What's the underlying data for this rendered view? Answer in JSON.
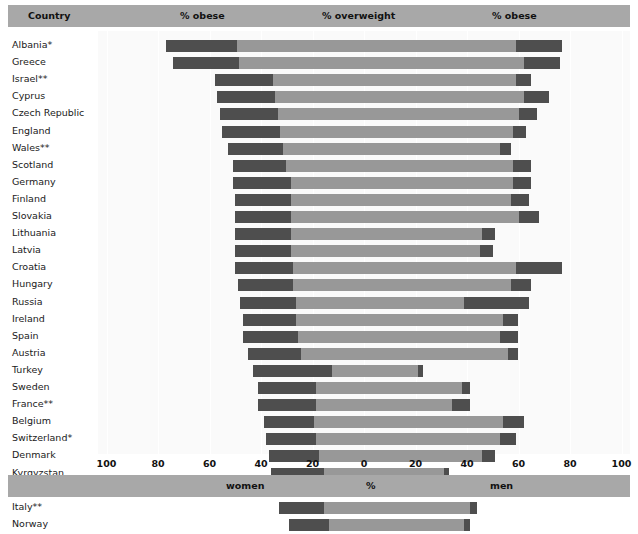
{
  "header": {
    "country_label": "Country",
    "left_section": "% obese",
    "middle_section": "% overweight",
    "right_section": "% obese"
  },
  "footer": {
    "left_label": "women",
    "middle_label": "%",
    "right_label": "men"
  },
  "axis": {
    "ticks": [
      "100",
      "80",
      "60",
      "40",
      "20",
      "0",
      "20",
      "40",
      "60",
      "80",
      "100"
    ],
    "tick_values": [
      -100,
      -80,
      -60,
      -40,
      -20,
      0,
      20,
      40,
      60,
      80,
      100
    ]
  },
  "chart_data": {
    "type": "bar",
    "title": "",
    "subtitle": "",
    "xlabel": "%",
    "ylabel": "Country",
    "xlim": [
      -100,
      100
    ],
    "grid": true,
    "legend": [
      "% obese",
      "% overweight"
    ],
    "legend_position": "top",
    "note": "Back-to-back (population pyramid) stacked bar chart. Women extend left from 0, men extend right from 0. Each side shows an inner dark '% obese' segment nearest the bar's outer end plus a lighter '% overweight' segment, plus an outer dark obese block.",
    "categories": [
      "Albania*",
      "Greece",
      "Israel**",
      "Cyprus",
      "Czech Republic",
      "England",
      "Wales**",
      "Scotland",
      "Germany",
      "Finland",
      "Slovakia",
      "Lithuania",
      "Latvia",
      "Croatia",
      "Hungary",
      "Russia",
      "Ireland",
      "Spain",
      "Austria",
      "Turkey",
      "Sweden",
      "France**",
      "Belgium",
      "Switzerland*",
      "Denmark",
      "Kyrgyzstan",
      "Netherlands",
      "Italy**",
      "Norway"
    ],
    "series": [
      {
        "name": "women_obese_outer",
        "side": "left",
        "values": [
          77,
          74,
          58,
          57,
          56,
          55,
          53,
          51,
          51,
          50,
          50,
          50,
          50,
          50,
          49,
          48,
          47,
          47,
          45,
          43,
          41,
          41,
          39,
          38,
          37,
          36,
          34,
          33,
          29
        ]
      },
      {
        "name": "women_obese_inner_break",
        "side": "left",
        "values": [
          58,
          57,
          44,
          43,
          42,
          41,
          40,
          39,
          37,
          37,
          37,
          37,
          37,
          36,
          36,
          35,
          35,
          34,
          33,
          21,
          27,
          27,
          28,
          27,
          26,
          24,
          25,
          24,
          22
        ]
      },
      {
        "name": "men_total",
        "side": "right",
        "values": [
          77,
          76,
          65,
          72,
          67,
          63,
          57,
          65,
          65,
          64,
          68,
          51,
          50,
          77,
          65,
          64,
          60,
          60,
          60,
          23,
          41,
          41,
          62,
          59,
          51,
          33,
          49,
          44,
          41
        ]
      },
      {
        "name": "men_obese_start",
        "side": "right",
        "values": [
          59,
          62,
          59,
          62,
          60,
          58,
          53,
          58,
          58,
          57,
          60,
          46,
          45,
          59,
          57,
          39,
          54,
          53,
          56,
          21,
          38,
          34,
          54,
          53,
          46,
          31,
          46,
          41,
          39
        ]
      }
    ]
  }
}
